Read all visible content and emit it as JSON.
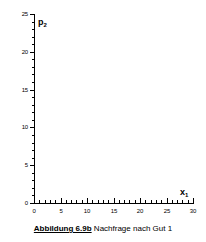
{
  "figure": {
    "caption_number": "Abbildung 6.9b",
    "caption_text": "Nachfrage nach Gut 1",
    "y_axis_variable": "p",
    "y_axis_subscript": "2",
    "x_axis_variable": "x",
    "x_axis_subscript": "1",
    "background_color": "#ffffff",
    "ink_color": "#000000"
  },
  "chart_data": {
    "type": "line",
    "title": "Abbildung 6.9b Nachfrage nach Gut 1",
    "xlabel": "x1",
    "ylabel": "p2",
    "xlim": [
      0,
      30
    ],
    "ylim": [
      0,
      25
    ],
    "grid": false,
    "legend": "none",
    "x_major_ticks": [
      0,
      5,
      10,
      15,
      20,
      25,
      30
    ],
    "x_major_tick_labels": [
      "0",
      "5",
      "10",
      "15",
      "20",
      "25",
      "30"
    ],
    "x_minor_tick_step": 1,
    "y_major_ticks": [
      0,
      5,
      10,
      15,
      20,
      25
    ],
    "y_major_tick_labels": [
      "0",
      "5",
      "10",
      "15",
      "20",
      "25"
    ],
    "y_minor_tick_step": 1,
    "series": [
      {
        "name": "Nachfrage nach Gut 1",
        "x": [],
        "y": []
      }
    ],
    "annotations": []
  }
}
